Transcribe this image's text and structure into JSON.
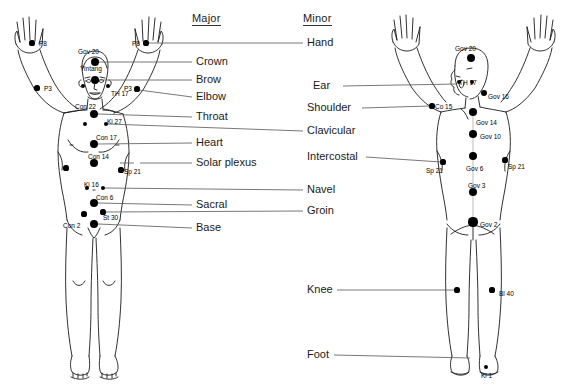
{
  "figure": {
    "title_major": "Major",
    "title_minor": "Minor",
    "view_left": "front",
    "view_right": "back"
  },
  "columns": {
    "major": {
      "header": "Major",
      "items": [
        {
          "label": "Crown",
          "y": 62
        },
        {
          "label": "Brow",
          "y": 80
        },
        {
          "label": "Elbow",
          "y": 97
        },
        {
          "label": "Throat",
          "y": 117
        },
        {
          "label": "Heart",
          "y": 143
        },
        {
          "label": "Solar plexus",
          "y": 163
        },
        {
          "label": "Navel",
          "y": 190
        },
        {
          "label": "Sacral",
          "y": 205
        },
        {
          "label": "Groin",
          "y": 211
        },
        {
          "label": "Base",
          "y": 228
        }
      ]
    },
    "minor": {
      "header": "Minor",
      "items": [
        {
          "label": "Hand",
          "y": 43
        },
        {
          "label": "Ear",
          "y": 86
        },
        {
          "label": "Shoulder",
          "y": 108
        },
        {
          "label": "Clavicular",
          "y": 131
        },
        {
          "label": "Intercostal",
          "y": 157
        },
        {
          "label": "Navel",
          "y": 190
        },
        {
          "label": "Groin",
          "y": 211
        },
        {
          "label": "Knee",
          "y": 290
        },
        {
          "label": "Foot",
          "y": 355
        }
      ]
    }
  },
  "left_figure": {
    "name": "front-body-figure",
    "points": [
      {
        "id": "P8-left",
        "label": "P8",
        "cx": 32,
        "cy": 43,
        "r": 2.6,
        "lx": 39,
        "ly": 40
      },
      {
        "id": "P3-left",
        "label": "P3",
        "cx": 37,
        "cy": 88,
        "r": 2.6,
        "lx": 44,
        "ly": 85
      },
      {
        "id": "P8-right",
        "label": "P8",
        "cx": 146,
        "cy": 43,
        "r": 2.6,
        "lx": 132,
        "ly": 40
      },
      {
        "id": "P3-right",
        "label": "P3",
        "cx": 137,
        "cy": 89,
        "r": 2.6,
        "lx": 124,
        "ly": 85
      },
      {
        "id": "Gov20",
        "label": "Gov 20",
        "cx": 95,
        "cy": 62,
        "r": 4.2,
        "lx": 78,
        "ly": 48
      },
      {
        "id": "Yintang",
        "label": "Yintang",
        "cx": 95,
        "cy": 80,
        "r": 4.2,
        "lx": 80,
        "ly": 65
      },
      {
        "id": "TH17-l",
        "label": "",
        "cx": 83,
        "cy": 86,
        "r": 2.2,
        "lx": 0,
        "ly": 0
      },
      {
        "id": "TH17-r",
        "label": "TH 17",
        "cx": 108,
        "cy": 86,
        "r": 2.2,
        "lx": 111,
        "ly": 90
      },
      {
        "id": "Con22",
        "label": "Con 22",
        "cx": 94,
        "cy": 114,
        "r": 4.2,
        "lx": 75,
        "ly": 103
      },
      {
        "id": "Ki27-l",
        "label": "",
        "cx": 85,
        "cy": 124,
        "r": 2.4,
        "lx": 0,
        "ly": 0
      },
      {
        "id": "Ki27-r",
        "label": "Ki 27",
        "cx": 106,
        "cy": 124,
        "r": 2.4,
        "lx": 107,
        "ly": 118
      },
      {
        "id": "Con17",
        "label": "Con 17",
        "cx": 94,
        "cy": 144,
        "r": 4.4,
        "lx": 96,
        "ly": 134
      },
      {
        "id": "Con14",
        "label": "Con 14",
        "cx": 94,
        "cy": 163,
        "r": 4.4,
        "lx": 88,
        "ly": 153
      },
      {
        "id": "Sp21-l",
        "label": "",
        "cx": 66,
        "cy": 168,
        "r": 2.6,
        "lx": 0,
        "ly": 0
      },
      {
        "id": "Sp21-r",
        "label": "Sp 21",
        "cx": 121,
        "cy": 170,
        "r": 2.6,
        "lx": 124,
        "ly": 168
      },
      {
        "id": "Ki16-l",
        "label": "Ki 16",
        "cx": 87,
        "cy": 188,
        "r": 2.4,
        "lx": 84,
        "ly": 181
      },
      {
        "id": "Ki16-r",
        "label": "",
        "cx": 103,
        "cy": 188,
        "r": 2.4,
        "lx": 0,
        "ly": 0
      },
      {
        "id": "Con6",
        "label": "Con 6",
        "cx": 94,
        "cy": 203,
        "r": 4.4,
        "lx": 96,
        "ly": 194
      },
      {
        "id": "St30-l",
        "label": "",
        "cx": 84,
        "cy": 214,
        "r": 2.6,
        "lx": 0,
        "ly": 0
      },
      {
        "id": "St30-r",
        "label": "St 30",
        "cx": 103,
        "cy": 212,
        "r": 2.6,
        "lx": 103,
        "ly": 214
      },
      {
        "id": "Con2",
        "label": "Con 2",
        "cx": 94,
        "cy": 224,
        "r": 4.4,
        "lx": 63,
        "ly": 222
      }
    ]
  },
  "right_figure": {
    "name": "back-body-figure",
    "points": [
      {
        "id": "Gov20-b",
        "label": "Gov 20",
        "cx": 471,
        "cy": 58,
        "r": 4.2,
        "lx": 455,
        "ly": 45
      },
      {
        "id": "TH17-bl",
        "label": "",
        "cx": 459,
        "cy": 82,
        "r": 2.4,
        "lx": 0,
        "ly": 0
      },
      {
        "id": "TH17-br",
        "label": "TH 17",
        "cx": 472,
        "cy": 82,
        "r": 2.4,
        "lx": 459,
        "ly": 79
      },
      {
        "id": "Gov16",
        "label": "Gov 16",
        "cx": 484,
        "cy": 93,
        "r": 3.0,
        "lx": 488,
        "ly": 93
      },
      {
        "id": "Co15",
        "label": "Co 15",
        "cx": 432,
        "cy": 106,
        "r": 2.6,
        "lx": 435,
        "ly": 103
      },
      {
        "id": "Gov14",
        "label": "Gov 14",
        "cx": 473,
        "cy": 112,
        "r": 4.2,
        "lx": 476,
        "ly": 119
      },
      {
        "id": "Gov10",
        "label": "Gov 10",
        "cx": 473,
        "cy": 134,
        "r": 4.2,
        "lx": 480,
        "ly": 133
      },
      {
        "id": "Gov6",
        "label": "Gov 6",
        "cx": 473,
        "cy": 156,
        "r": 4.2,
        "lx": 466,
        "ly": 165
      },
      {
        "id": "Sp21-bl",
        "label": "Sp 21",
        "cx": 443,
        "cy": 162,
        "r": 2.6,
        "lx": 426,
        "ly": 167
      },
      {
        "id": "Sp21-br",
        "label": "Sp 21",
        "cx": 505,
        "cy": 160,
        "r": 2.6,
        "lx": 508,
        "ly": 163
      },
      {
        "id": "Gov3",
        "label": "Gov 3",
        "cx": 473,
        "cy": 192,
        "r": 4.2,
        "lx": 468,
        "ly": 182
      },
      {
        "id": "Gov2",
        "label": "Gov 2",
        "cx": 473,
        "cy": 222,
        "r": 4.6,
        "lx": 480,
        "ly": 221
      },
      {
        "id": "Knee-l",
        "label": "",
        "cx": 457,
        "cy": 290,
        "r": 2.6,
        "lx": 0,
        "ly": 0
      },
      {
        "id": "Bl40",
        "label": "Bl 40",
        "cx": 492,
        "cy": 290,
        "r": 2.6,
        "lx": 499,
        "ly": 290
      },
      {
        "id": "Ki1",
        "label": "Ki 1",
        "cx": 486,
        "cy": 367,
        "r": 2.4,
        "lx": 481,
        "ly": 372
      }
    ]
  },
  "colors": {
    "ink": "#000000",
    "text": "#1a1a1a",
    "leader": "#555555",
    "body_outline": "#1a1a1a",
    "background": "#ffffff"
  }
}
